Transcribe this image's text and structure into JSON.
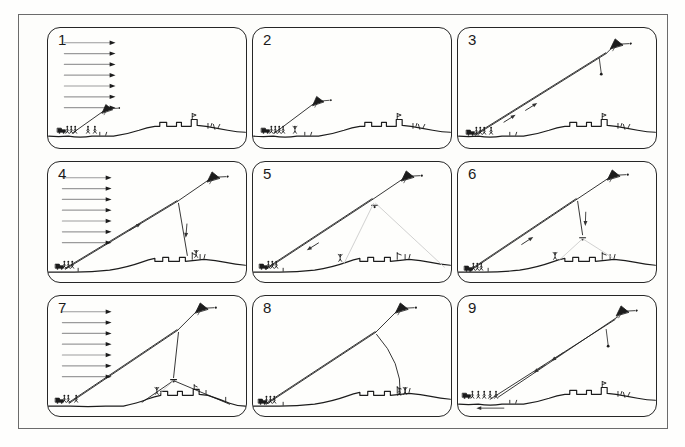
{
  "page": {
    "background": "#fefefd",
    "outer_border_color": "#6b6b6b",
    "panel_border_color": "#262626",
    "ink_color": "#1c1c1c",
    "wind_shaft_color": "#9b9b9b",
    "light_line_color": "#c4c4c4",
    "arrow_color": "#333333"
  },
  "icons": {
    "kite": "kite-icon",
    "wind_arrow": "wind-arrow-icon",
    "line_arrow": "direction-arrow-icon",
    "weight": "pendant-weight-icon",
    "figure": "stick-figure",
    "vehicle": "cart-icon",
    "ground": "terrain-profile"
  },
  "grounds": {
    "A": {
      "path": "M0,110 Q10,111 20,110 Q32,112 44,110 L66,110 Q80,108 92,104 Q100,101 108,100 L113,100 L113,96 L120,96 L120,100 L130,100 L130,96 L135,96 L135,100 L145,100 L145,93 L151,93 L151,99 L160,100 Q172,102 182,104 Q192,106 200,106",
      "decor": "M146,93 l0,-6 M146,87 l4,1.5 l-4,1.7 M162,102 l0,-5 M165,100 l1,-3 M169,103 l-1.5,-5 M172,102 l2,-4 M52,109 l0,-3 M58,109 l1,-3"
    },
    "B": {
      "path": "M0,112 L26,112 Q44,112 62,110 Q80,107 94,102 Q102,99 108,98 L108,101 L116,101 L116,97 L122,97 L122,101 L133,101 L133,97 L139,97 L139,101 L149,100 L158,99 Q170,100 180,102 Q190,104 200,105",
      "decor": "M146,99 l0,-7 M146,93 l4,1.5 M154,99 l0,-5 M158,98 l1,-4 M30,111 l0,-3"
    },
    "C": {
      "path": "M0,112 L22,112 Q40,113 58,112 L76,112 Q90,109 100,105 Q108,102 114,101 L114,97 L121,97 L121,101 L131,101 L131,97 L136,97 L136,101 L147,101 L147,95 L153,95 L153,100 L162,101 Q174,105 184,109 Q192,112 200,112",
      "decor": "M148,95 l0,-5 M148,91 l3,1.4 M160,100 l0,-4 M180,107 l0,-4"
    }
  },
  "panels": [
    {
      "label": "1",
      "name": "panel-1",
      "ground": "A",
      "elements": [
        {
          "t": "wind",
          "x": 16,
          "y": 15,
          "n": 7,
          "dy": 11,
          "len": 46
        },
        {
          "t": "sline",
          "x1": 24,
          "y1": 107,
          "x2": 55,
          "y2": 85
        },
        {
          "t": "kite",
          "x": 59,
          "y": 82,
          "s": 0.85,
          "a": -12
        },
        {
          "t": "vehicle",
          "x": 9,
          "y": 106
        },
        {
          "t": "crew",
          "x": 19,
          "y": 107,
          "n": 3,
          "sp": 4
        },
        {
          "t": "fig",
          "x": 40,
          "y": 107
        },
        {
          "t": "fig",
          "x": 47,
          "y": 107
        }
      ]
    },
    {
      "label": "2",
      "name": "panel-2",
      "ground": "A",
      "elements": [
        {
          "t": "sline",
          "x1": 21,
          "y1": 107,
          "x2": 61,
          "y2": 77
        },
        {
          "t": "kite",
          "x": 65,
          "y": 74,
          "s": 0.9,
          "a": -12
        },
        {
          "t": "vehicle",
          "x": 8,
          "y": 106
        },
        {
          "t": "crew",
          "x": 18,
          "y": 107,
          "n": 4,
          "sp": 4
        },
        {
          "t": "fig",
          "x": 42,
          "y": 107,
          "pose": "arms"
        }
      ]
    },
    {
      "label": "3",
      "name": "panel-3",
      "ground": "A",
      "elements": [
        {
          "t": "dline",
          "x1": 17,
          "y1": 109,
          "x2": 150,
          "y2": 26
        },
        {
          "t": "sline",
          "x1": 150,
          "y1": 26,
          "x2": 157,
          "y2": 19
        },
        {
          "t": "kite",
          "x": 160,
          "y": 16,
          "s": 1,
          "a": -10
        },
        {
          "t": "weight",
          "x": 143,
          "y": 31,
          "len": 15
        },
        {
          "t": "larrow",
          "x": 52,
          "y": 92,
          "a": -32
        },
        {
          "t": "larrow",
          "x": 74,
          "y": 80,
          "a": -32
        },
        {
          "t": "vehicle",
          "x": 8,
          "y": 108
        },
        {
          "t": "crew",
          "x": 18,
          "y": 108,
          "n": 3,
          "sp": 4
        },
        {
          "t": "fig",
          "x": 33,
          "y": 108
        }
      ]
    },
    {
      "label": "4",
      "name": "panel-4",
      "ground": "B",
      "elements": [
        {
          "t": "wind",
          "x": 14,
          "y": 16,
          "n": 7,
          "dy": 11,
          "len": 44
        },
        {
          "t": "dline",
          "x1": 17,
          "y1": 109,
          "x2": 131,
          "y2": 40
        },
        {
          "t": "sline",
          "x1": 131,
          "y1": 40,
          "x2": 163,
          "y2": 18
        },
        {
          "t": "kite",
          "x": 167,
          "y": 15,
          "s": 1,
          "a": -10
        },
        {
          "t": "sline",
          "x1": 132,
          "y1": 42,
          "x2": 141,
          "y2": 95
        },
        {
          "t": "larrow",
          "x": 140,
          "y": 70,
          "a": 95
        },
        {
          "t": "larrow",
          "x": 88,
          "y": 66,
          "a": -31
        },
        {
          "t": "vehicle",
          "x": 7,
          "y": 108
        },
        {
          "t": "crew",
          "x": 16,
          "y": 108,
          "n": 3,
          "sp": 4
        },
        {
          "t": "fig",
          "x": 150,
          "y": 97,
          "pose": "arms"
        }
      ]
    },
    {
      "label": "5",
      "name": "panel-5",
      "ground": "B",
      "elements": [
        {
          "t": "dline",
          "x1": 13,
          "y1": 109,
          "x2": 121,
          "y2": 38
        },
        {
          "t": "sline",
          "x1": 121,
          "y1": 38,
          "x2": 152,
          "y2": 17
        },
        {
          "t": "kite",
          "x": 156,
          "y": 14,
          "s": 1,
          "a": -10
        },
        {
          "t": "block",
          "x": 123,
          "y": 44
        },
        {
          "t": "lline",
          "x1": 122,
          "y1": 42,
          "x2": 92,
          "y2": 103
        },
        {
          "t": "lline",
          "x1": 124,
          "y1": 42,
          "x2": 194,
          "y2": 107
        },
        {
          "t": "larrow",
          "x": 60,
          "y": 86,
          "a": 148
        },
        {
          "t": "fig",
          "x": 88,
          "y": 101,
          "pose": "arms"
        },
        {
          "t": "vehicle",
          "x": 6,
          "y": 108
        },
        {
          "t": "crew",
          "x": 15,
          "y": 108,
          "n": 3,
          "sp": 4
        }
      ]
    },
    {
      "label": "6",
      "name": "panel-6",
      "ground": "B",
      "elements": [
        {
          "t": "dline",
          "x1": 11,
          "y1": 111,
          "x2": 120,
          "y2": 38
        },
        {
          "t": "sline",
          "x1": 120,
          "y1": 38,
          "x2": 153,
          "y2": 16
        },
        {
          "t": "kite",
          "x": 157,
          "y": 13,
          "s": 1,
          "a": -10
        },
        {
          "t": "sline",
          "x1": 121,
          "y1": 40,
          "x2": 126,
          "y2": 74
        },
        {
          "t": "larrow",
          "x": 129,
          "y": 58,
          "a": 92
        },
        {
          "t": "block",
          "x": 126,
          "y": 77
        },
        {
          "t": "lline",
          "x1": 126,
          "y1": 78,
          "x2": 102,
          "y2": 100
        },
        {
          "t": "lline",
          "x1": 126,
          "y1": 78,
          "x2": 156,
          "y2": 97
        },
        {
          "t": "fig",
          "x": 98,
          "y": 99,
          "pose": "arms"
        },
        {
          "t": "larrow",
          "x": 70,
          "y": 80,
          "a": -33
        },
        {
          "t": "vehicle",
          "x": 6,
          "y": 110
        },
        {
          "t": "crew",
          "x": 15,
          "y": 110,
          "n": 3,
          "sp": 4
        }
      ]
    },
    {
      "label": "7",
      "name": "panel-7",
      "ground": "C",
      "elements": [
        {
          "t": "wind",
          "x": 14,
          "y": 16,
          "n": 7,
          "dy": 11,
          "len": 44
        },
        {
          "t": "dline",
          "x1": 21,
          "y1": 109,
          "x2": 131,
          "y2": 35
        },
        {
          "t": "sline",
          "x1": 131,
          "y1": 35,
          "x2": 151,
          "y2": 15
        },
        {
          "t": "kite",
          "x": 155,
          "y": 12,
          "s": 1,
          "a": -10
        },
        {
          "t": "sline",
          "x1": 132,
          "y1": 37,
          "x2": 127,
          "y2": 83
        },
        {
          "t": "block",
          "x": 127,
          "y": 85
        },
        {
          "t": "sline",
          "x1": 127,
          "y1": 86,
          "x2": 95,
          "y2": 108
        },
        {
          "t": "sline",
          "x1": 127,
          "y1": 86,
          "x2": 184,
          "y2": 110
        },
        {
          "t": "lline",
          "x1": 127,
          "y1": 86,
          "x2": 112,
          "y2": 100
        },
        {
          "t": "fig",
          "x": 110,
          "y": 100,
          "pose": "arms"
        },
        {
          "t": "vehicle",
          "x": 7,
          "y": 108
        },
        {
          "t": "crew",
          "x": 16,
          "y": 108,
          "n": 2,
          "sp": 4
        },
        {
          "t": "fig",
          "x": 28,
          "y": 108
        }
      ]
    },
    {
      "label": "8",
      "name": "panel-8",
      "ground": "B",
      "elements": [
        {
          "t": "dline",
          "x1": 13,
          "y1": 110,
          "x2": 124,
          "y2": 37
        },
        {
          "t": "sline",
          "x1": 124,
          "y1": 37,
          "x2": 146,
          "y2": 15
        },
        {
          "t": "kite",
          "x": 150,
          "y": 12,
          "s": 1,
          "a": -10
        },
        {
          "t": "path",
          "d": "M125,39 Q151,68 149,100"
        },
        {
          "t": "fig",
          "x": 148,
          "y": 101
        },
        {
          "t": "fig",
          "x": 154,
          "y": 100,
          "pose": "arms"
        },
        {
          "t": "vehicle",
          "x": 5,
          "y": 109
        },
        {
          "t": "crew",
          "x": 13,
          "y": 109,
          "n": 3,
          "sp": 4
        }
      ]
    },
    {
      "label": "9",
      "name": "panel-9",
      "ground": "A",
      "elements": [
        {
          "t": "sline",
          "x1": 40,
          "y1": 103,
          "x2": 162,
          "y2": 21
        },
        {
          "t": "sline",
          "x1": 32,
          "y1": 105,
          "x2": 159,
          "y2": 24
        },
        {
          "t": "kite",
          "x": 166,
          "y": 15,
          "s": 1,
          "a": -10
        },
        {
          "t": "weight",
          "x": 150,
          "y": 34,
          "len": 16
        },
        {
          "t": "larrow",
          "x": 100,
          "y": 62,
          "a": 146
        },
        {
          "t": "larrow",
          "x": 82,
          "y": 74,
          "a": 146
        },
        {
          "t": "harrow",
          "x1": 46,
          "y1": 114,
          "x2": 18,
          "y2": 114
        },
        {
          "t": "vehicle",
          "x": 4,
          "y": 103
        },
        {
          "t": "crew",
          "x": 14,
          "y": 104,
          "n": 5,
          "sp": 6
        }
      ]
    }
  ]
}
